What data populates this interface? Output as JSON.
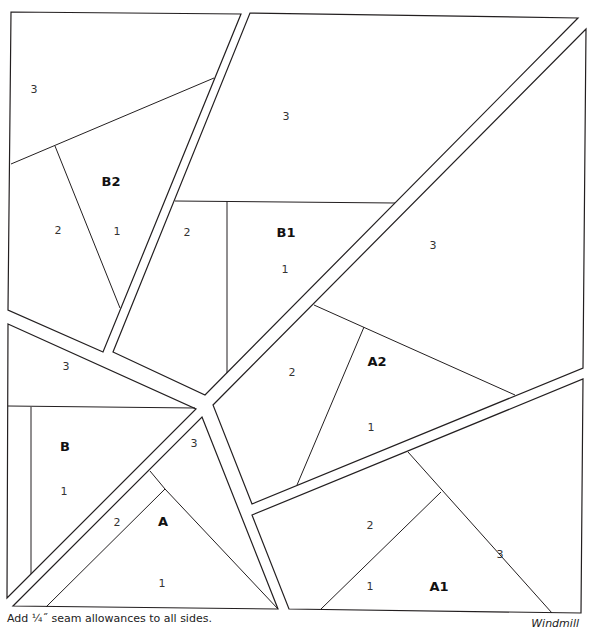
{
  "title": "Windmill",
  "footnote": "Add ¼˝ seam allowances to all sides.",
  "caption": "Windmill",
  "units": [
    {
      "id": "B2",
      "label": "B2",
      "sections": [
        "1",
        "2",
        "3"
      ]
    },
    {
      "id": "B1",
      "label": "B1",
      "sections": [
        "1",
        "2",
        "3"
      ]
    },
    {
      "id": "A2",
      "label": "A2",
      "sections": [
        "1",
        "2",
        "3"
      ]
    },
    {
      "id": "B",
      "label": "B",
      "sections": [
        "1",
        "2",
        "3"
      ]
    },
    {
      "id": "A",
      "label": "A",
      "sections": [
        "1",
        "2",
        "3"
      ]
    },
    {
      "id": "A1",
      "label": "A1",
      "sections": [
        "1",
        "2",
        "3"
      ]
    }
  ],
  "labels": {
    "b2_3": "3",
    "b2_2": "2",
    "b2_1": "1",
    "b2": "B2",
    "b1_3": "3",
    "b1_2": "2",
    "b1_1": "1",
    "b1": "B1",
    "a2_3": "3",
    "a2_2": "2",
    "a2_1": "1",
    "a2": "A2",
    "b_3": "3",
    "b_1": "1",
    "b": "B",
    "a_3": "3",
    "a_2": "2",
    "a_1": "1",
    "a": "A",
    "a1_3": "3",
    "a1_2": "2",
    "a1_1": "1",
    "a1": "A1"
  }
}
